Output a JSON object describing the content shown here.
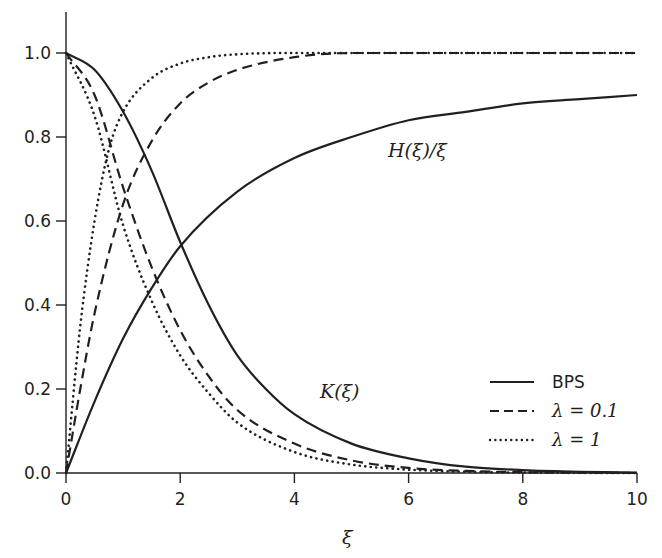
{
  "chart_data": {
    "type": "line",
    "title": "",
    "xlabel": "ξ",
    "ylabel": "",
    "xlim": [
      0,
      10
    ],
    "ylim": [
      0,
      1.1
    ],
    "x_ticks": [
      0,
      2,
      4,
      6,
      8,
      10
    ],
    "x_tick_labels": [
      "0",
      "2",
      "4",
      "6",
      "8",
      "10"
    ],
    "y_ticks": [
      0.0,
      0.2,
      0.4,
      0.6,
      0.8,
      1.0
    ],
    "y_tick_labels": [
      "0.0",
      "0.2",
      "0.4",
      "0.6",
      "0.8",
      "1.0"
    ],
    "grid": false,
    "legend_position": "lower right",
    "annotations": [
      {
        "text": "H(ξ)/ξ",
        "x": 5.5,
        "y": 0.78
      },
      {
        "text": "K(ξ)",
        "x": 4.6,
        "y": 0.2
      }
    ],
    "series": [
      {
        "name": "BPS",
        "function": "H(ξ)/ξ",
        "style": "solid",
        "x": [
          0,
          0.5,
          1,
          1.5,
          2,
          3,
          4,
          5,
          6,
          7,
          8,
          9,
          10
        ],
        "y": [
          0,
          0.17,
          0.32,
          0.44,
          0.54,
          0.67,
          0.75,
          0.8,
          0.84,
          0.86,
          0.88,
          0.89,
          0.9
        ]
      },
      {
        "name": "BPS",
        "function": "K(ξ)",
        "style": "solid",
        "x": [
          0,
          0.5,
          1,
          1.5,
          2,
          2.5,
          3,
          3.5,
          4,
          5,
          6,
          7,
          8,
          9,
          10
        ],
        "y": [
          1.0,
          0.96,
          0.86,
          0.72,
          0.55,
          0.4,
          0.28,
          0.2,
          0.14,
          0.07,
          0.035,
          0.015,
          0.007,
          0.003,
          0.001
        ]
      },
      {
        "name": "λ = 0.1",
        "function": "H(ξ)/ξ",
        "style": "dashed",
        "x": [
          0,
          0.25,
          0.5,
          1,
          1.5,
          2,
          2.5,
          3,
          4,
          5,
          6,
          8,
          10
        ],
        "y": [
          0,
          0.2,
          0.38,
          0.64,
          0.79,
          0.88,
          0.93,
          0.96,
          0.99,
          1.0,
          1.0,
          1.0,
          1.0
        ]
      },
      {
        "name": "λ = 0.1",
        "function": "K(ξ)",
        "style": "dashed",
        "x": [
          0,
          0.5,
          1,
          1.5,
          2,
          2.5,
          3,
          4,
          5,
          6,
          7,
          8,
          10
        ],
        "y": [
          1.0,
          0.9,
          0.68,
          0.49,
          0.34,
          0.23,
          0.15,
          0.07,
          0.03,
          0.012,
          0.005,
          0.002,
          0.0
        ]
      },
      {
        "name": "λ = 1",
        "function": "H(ξ)/ξ",
        "style": "dotted",
        "x": [
          0,
          0.25,
          0.5,
          0.75,
          1,
          1.5,
          2,
          2.5,
          3,
          4,
          5,
          10
        ],
        "y": [
          0,
          0.35,
          0.6,
          0.77,
          0.86,
          0.94,
          0.975,
          0.99,
          0.997,
          1.0,
          1.0,
          1.0
        ]
      },
      {
        "name": "λ = 1",
        "function": "K(ξ)",
        "style": "dotted",
        "x": [
          0,
          0.5,
          1,
          1.5,
          2,
          2.5,
          3,
          4,
          5,
          6,
          7,
          8,
          10
        ],
        "y": [
          1.0,
          0.85,
          0.59,
          0.41,
          0.28,
          0.19,
          0.12,
          0.05,
          0.02,
          0.008,
          0.003,
          0.001,
          0.0
        ]
      }
    ]
  },
  "labels": {
    "x_axis": "ξ",
    "h_curve": "H(ξ)/ξ",
    "k_curve": "K(ξ)"
  },
  "legend": {
    "items": [
      {
        "label": "BPS",
        "style": "solid"
      },
      {
        "label": "λ = 0.1",
        "style": "dashed"
      },
      {
        "label": "λ = 1",
        "style": "dotted"
      }
    ]
  }
}
